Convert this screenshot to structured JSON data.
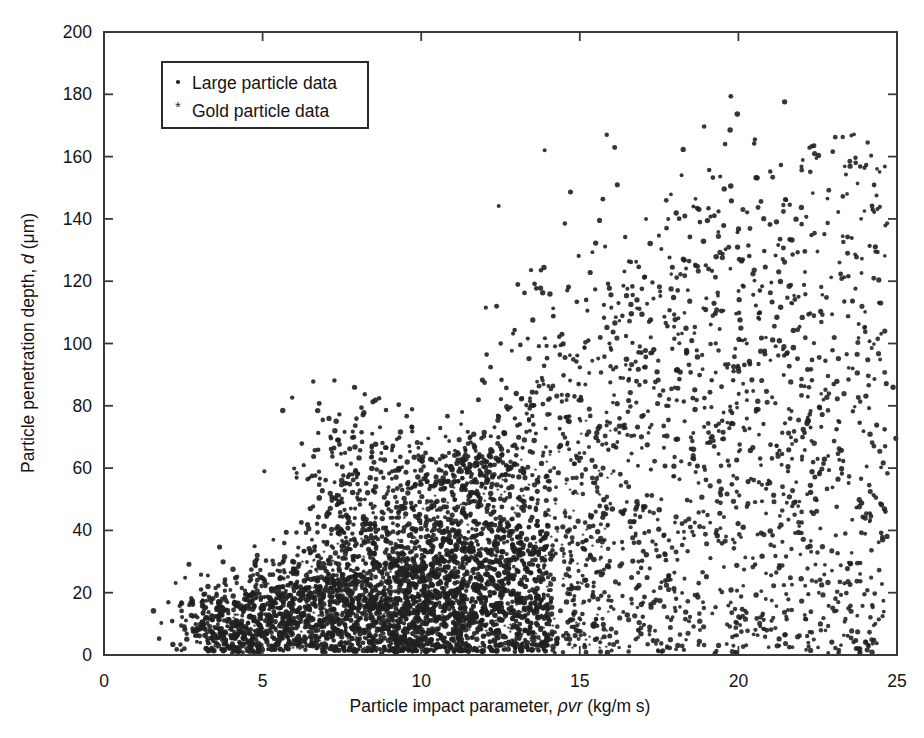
{
  "chart_data": {
    "type": "scatter",
    "title": "",
    "xlabel": "Particle impact parameter, ρvr (kg/m s)",
    "xlabel_parts": {
      "prefix": "Particle impact parameter, ",
      "symbol": "ρvr",
      "units": " (kg/m s)"
    },
    "ylabel": "Particle penetration depth, d (μm)",
    "ylabel_parts": {
      "prefix": "Particle penetration depth, ",
      "symbol": "d",
      "units": " (μm)"
    },
    "xlim": [
      0,
      25
    ],
    "ylim": [
      0,
      200
    ],
    "xticks": [
      0,
      5,
      10,
      15,
      20,
      25
    ],
    "yticks": [
      0,
      20,
      40,
      60,
      80,
      100,
      120,
      140,
      160,
      180,
      200
    ],
    "xtick_labels": [
      "0",
      "5",
      "10",
      "15",
      "20",
      "25"
    ],
    "ytick_labels": [
      "0",
      "20",
      "40",
      "60",
      "80",
      "100",
      "120",
      "140",
      "160",
      "180",
      "200"
    ],
    "grid": false,
    "tick_direction": "in",
    "legend_position": "upper-left",
    "legend": [
      {
        "label": "Large particle data",
        "marker": "dot",
        "color": "#202020"
      },
      {
        "label": "Gold particle data",
        "marker": "asterisk",
        "color": "#202020"
      }
    ],
    "series": [
      {
        "name": "Large particle data",
        "marker": "dot",
        "color": "#202020",
        "marker_size": 2.0,
        "n_points": 2600,
        "description": "Dense wedge-shaped cloud rising from low impact parameter to high; strongly concentrated below d=60 for rho*v*r between 3 and 13",
        "clusters": [
          {
            "cx": 4.0,
            "cy": 10,
            "sx": 0.9,
            "sy": 7,
            "n": 260
          },
          {
            "cx": 6.5,
            "cy": 16,
            "sx": 1.4,
            "sy": 11,
            "n": 300
          },
          {
            "cx": 8.2,
            "cy": 22,
            "sx": 1.5,
            "sy": 15,
            "n": 340
          },
          {
            "cx": 9.6,
            "cy": 18,
            "sx": 1.3,
            "sy": 13,
            "n": 330
          },
          {
            "cx": 11.0,
            "cy": 20,
            "sx": 1.5,
            "sy": 15,
            "n": 300
          },
          {
            "cx": 11.6,
            "cy": 56,
            "sx": 0.9,
            "sy": 9,
            "n": 230
          },
          {
            "cx": 8.1,
            "cy": 62,
            "sx": 1.1,
            "sy": 11,
            "n": 150
          },
          {
            "cx": 10.1,
            "cy": 40,
            "sx": 1.8,
            "sy": 16,
            "n": 200
          },
          {
            "cx": 12.6,
            "cy": 22,
            "sx": 1.3,
            "sy": 16,
            "n": 180
          },
          {
            "cx": 14.6,
            "cy": 45,
            "sx": 1.5,
            "sy": 28,
            "n": 130
          },
          {
            "cx": 16.5,
            "cy": 28,
            "sx": 1.4,
            "sy": 20,
            "n": 90
          },
          {
            "cx": 19.8,
            "cy": 95,
            "sx": 1.6,
            "sy": 35,
            "n": 90
          },
          {
            "cx": 21.5,
            "cy": 55,
            "sx": 1.8,
            "sy": 30,
            "n": 90
          },
          {
            "cx": 23.3,
            "cy": 45,
            "sx": 1.3,
            "sy": 25,
            "n": 60
          },
          {
            "cx": 15.0,
            "cy": 105,
            "sx": 1.2,
            "sy": 28,
            "n": 60
          },
          {
            "cx": 20.1,
            "cy": 135,
            "sx": 1.3,
            "sy": 20,
            "n": 45
          }
        ],
        "range_x": [
          2.8,
          24.7
        ],
        "range_y": [
          1,
          168
        ]
      },
      {
        "name": "Gold particle data",
        "marker": "asterisk",
        "color": "#2a2a2a",
        "marker_size": 2.0,
        "n_points": 400,
        "description": "Interleaved with large particle data, concentrated in the low-to-mid impact parameter band",
        "range_x": [
          3.0,
          16.0
        ],
        "range_y": [
          2,
          80
        ]
      }
    ],
    "notable_features": [
      "Wedge / fan shaped spread: penetration depth increases with impact parameter",
      "Dense dark core near rho*v*r = 7-12, d = 5-30",
      "Secondary dense blob near rho*v*r = 11.5, d = 55",
      "Sparse scatter with highest points reaching d ~ 168 near rho*v*r = 20-22",
      "No data below rho*v*r ~ 2.8"
    ]
  },
  "axes": {
    "frame_color": "#3a3a3a",
    "point_color": "#202020",
    "background": "#ffffff"
  }
}
